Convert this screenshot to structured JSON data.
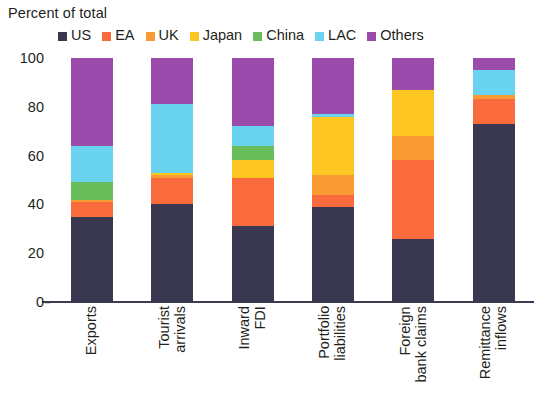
{
  "chart_data": {
    "type": "bar",
    "stacked": true,
    "stack_total": 100,
    "title": "Percent of total",
    "subtitle": "",
    "xlabel": "",
    "ylabel": "",
    "ylim": [
      0,
      100
    ],
    "yticks": [
      100,
      80,
      60,
      40,
      20,
      0
    ],
    "grid": false,
    "legend_position": "top",
    "categories": [
      "Exports",
      "Tourist\narrivals",
      "Inward\nFDI",
      "Portfolio\nliabilities",
      "Foreign\nbank claims",
      "Remittance\ninflows"
    ],
    "series": [
      {
        "name": "US",
        "color": "#393850",
        "values": [
          35,
          40,
          31,
          39,
          26,
          73
        ]
      },
      {
        "name": "EA",
        "color": "#f96a3c",
        "values": [
          6,
          11,
          20,
          5,
          32,
          10
        ]
      },
      {
        "name": "UK",
        "color": "#fa9a33",
        "values": [
          1,
          1,
          0,
          8,
          10,
          2
        ]
      },
      {
        "name": "Japan",
        "color": "#fdc623",
        "values": [
          0,
          1,
          7,
          24,
          19,
          0
        ]
      },
      {
        "name": "China",
        "color": "#69bd5b",
        "values": [
          7,
          0,
          6,
          0,
          0,
          0
        ]
      },
      {
        "name": "LAC",
        "color": "#6ad4f0",
        "values": [
          15,
          28,
          8,
          1,
          0,
          10
        ]
      },
      {
        "name": "Others",
        "color": "#9a4bab",
        "values": [
          36,
          19,
          28,
          23,
          13,
          5
        ]
      }
    ]
  },
  "legend": {
    "items": [
      {
        "label": "US",
        "color": "#393850"
      },
      {
        "label": "EA",
        "color": "#f96a3c"
      },
      {
        "label": "UK",
        "color": "#fa9a33"
      },
      {
        "label": "Japan",
        "color": "#fdc623"
      },
      {
        "label": "China",
        "color": "#69bd5b"
      },
      {
        "label": "LAC",
        "color": "#6ad4f0"
      },
      {
        "label": "Others",
        "color": "#9a4bab"
      }
    ]
  },
  "axis": {
    "title": "Percent of total",
    "ytick_labels": [
      "100",
      "80",
      "60",
      "40",
      "20",
      "0"
    ],
    "xtick_labels": [
      "Exports",
      "Tourist\narrivals",
      "Inward\nFDI",
      "Portfolio\nliabilities",
      "Foreign\nbank claims",
      "Remittance\ninflows"
    ]
  },
  "colors": {
    "axis": "#3c3b54",
    "text": "#231f20",
    "background": "#ffffff"
  }
}
